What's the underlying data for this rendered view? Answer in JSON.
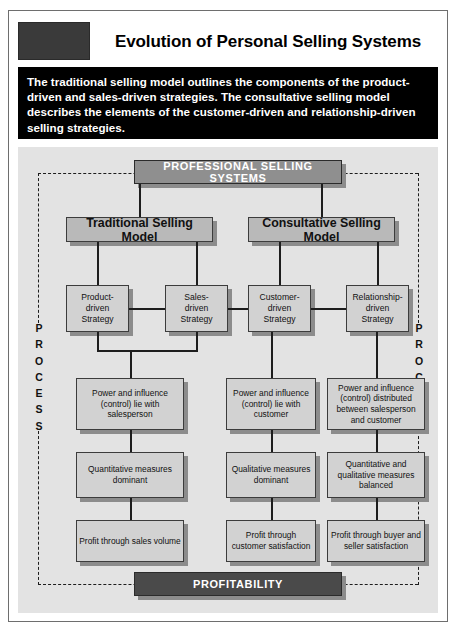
{
  "header": {
    "title": "Evolution of Personal Selling Systems",
    "logo_block": "dark-placeholder-block"
  },
  "description": "The traditional selling model outlines the components of the product-driven and sales-driven strategies. The consultative selling model describes the elements of the customer-driven and relationship-driven selling strategies.",
  "diagram": {
    "top_banner": "PROFESSIONAL SELLING SYSTEMS",
    "bottom_banner": "PROFITABILITY",
    "process_label_left": "PROCESS",
    "process_label_right": "PROCESS",
    "models": [
      {
        "label": "Traditional Selling Model"
      },
      {
        "label": "Consultative Selling Model"
      }
    ],
    "strategies": [
      {
        "label": "Product-\ndriven\nStrategy"
      },
      {
        "label": "Sales-\ndriven\nStrategy"
      },
      {
        "label": "Customer-\ndriven\nStrategy"
      },
      {
        "label": "Relationship-\ndriven\nStrategy"
      }
    ],
    "columns": [
      {
        "power": "Power and influence (control) lie with salesperson",
        "measures": "Quantitative measures dominant",
        "profit": "Profit through sales volume"
      },
      {
        "power": "Power and influence (control) lie with customer",
        "measures": "Qualitative measures dominant",
        "profit": "Profit through customer satisfaction"
      },
      {
        "power": "Power and influence (control) distributed between salesperson and customer",
        "measures": "Quantitative and qualitative measures balanced",
        "profit": "Profit through buyer and seller satisfaction"
      }
    ]
  },
  "colors": {
    "page_background": "#ffffff",
    "panel_background": "#e3e3e3",
    "description_background": "#000000",
    "box_fill": "#d2d2d2",
    "banner_fill": "#8f8f8f",
    "profitability_fill": "#4a4a4a",
    "shadow": "#8c8c8c",
    "border": "#3c3c3c"
  }
}
